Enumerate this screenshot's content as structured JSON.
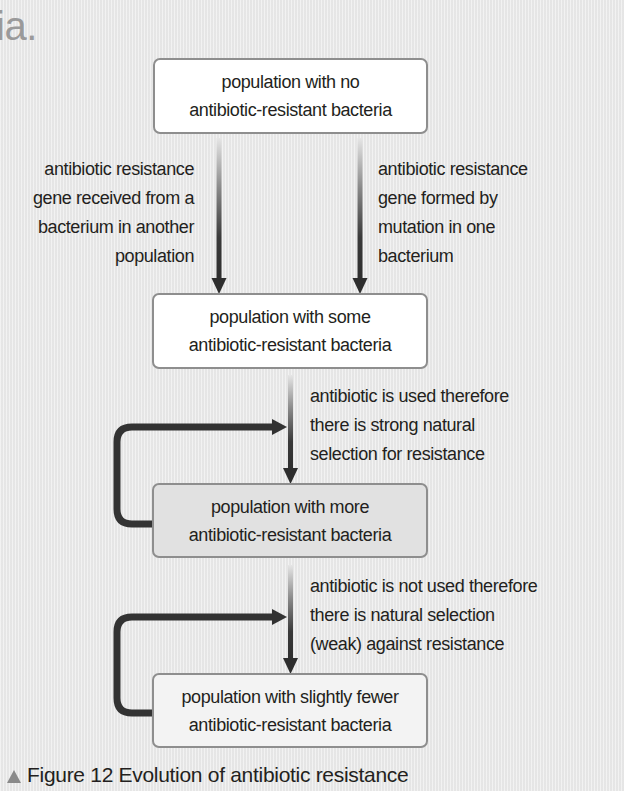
{
  "heading_fragment": "ia.",
  "diagram": {
    "boxes": [
      {
        "id": "no-resistant",
        "lines": [
          "population with no",
          "antibiotic-resistant bacteria"
        ],
        "fill": "#ffffff"
      },
      {
        "id": "some-resistant",
        "lines": [
          "population with some",
          "antibiotic-resistant bacteria"
        ],
        "fill": "#ffffff"
      },
      {
        "id": "more-resistant",
        "lines": [
          "population with more",
          "antibiotic-resistant bacteria"
        ],
        "fill": "#e1e1e1"
      },
      {
        "id": "fewer-resistant",
        "lines": [
          "population with slightly  fewer",
          "antibiotic-resistant bacteria"
        ],
        "fill": "#f3f3f3"
      }
    ],
    "labels": {
      "gene_transfer": [
        "antibiotic resistance",
        "gene received from a",
        "bacterium in another",
        "population"
      ],
      "gene_mutation": [
        "antibiotic resistance",
        "gene formed by",
        "mutation in one",
        "bacterium"
      ],
      "antibiotic_used": [
        "antibiotic is used therefore",
        "there is strong natural",
        "selection for resistance"
      ],
      "antibiotic_not_used": [
        "antibiotic is not used therefore",
        "there is natural selection",
        "(weak) against resistance"
      ]
    },
    "edges": [
      {
        "from": "no-resistant",
        "to": "some-resistant",
        "label": "gene_transfer"
      },
      {
        "from": "no-resistant",
        "to": "some-resistant",
        "label": "gene_mutation"
      },
      {
        "from": "some-resistant",
        "to": "more-resistant",
        "label": "antibiotic_used"
      },
      {
        "from": "more-resistant",
        "to": "some-to-more-edge",
        "type": "feedback-loop"
      },
      {
        "from": "more-resistant",
        "to": "fewer-resistant",
        "label": "antibiotic_not_used"
      },
      {
        "from": "fewer-resistant",
        "to": "more-to-fewer-edge",
        "type": "feedback-loop"
      }
    ],
    "colors": {
      "arrow_dark": "#333333",
      "arrow_light": "#e0e0e0",
      "box_border": "#8e8e8e",
      "caption_marker": "#8a8a8a"
    }
  },
  "caption": {
    "marker": "triangle-up",
    "text": "Figure 12 Evolution of antibiotic resistance"
  }
}
